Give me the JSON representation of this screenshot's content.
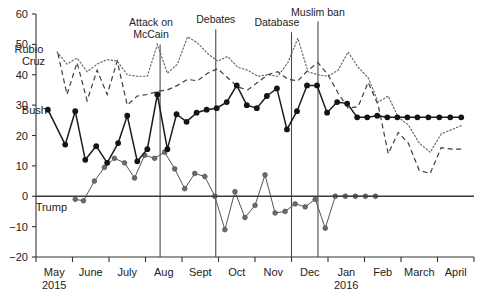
{
  "chart_data": {
    "type": "line",
    "title": "",
    "xlabel": "",
    "ylabel": "",
    "ylim": [
      -20,
      60
    ],
    "yticks": [
      -20,
      -10,
      0,
      10,
      20,
      30,
      40,
      50,
      60
    ],
    "ytick_labels": [
      "−20",
      "−10",
      "0",
      "10",
      "20",
      "30",
      "40",
      "50",
      "60"
    ],
    "grid": false,
    "legend_position": "inline-left",
    "x_axis_label_rows": [
      [
        "May",
        "June",
        "July",
        "Aug",
        "Sept",
        "Oct",
        "Nov",
        "Dec",
        "Jan",
        "Feb",
        "March",
        "April"
      ],
      [
        "2015",
        "",
        "",
        "",
        "",
        "",
        "",
        "",
        "2016",
        "",
        "",
        ""
      ]
    ],
    "x_month_ticks": [
      "May",
      "June",
      "July",
      "Aug",
      "Sept",
      "Oct",
      "Nov",
      "Dec",
      "Jan",
      "Feb",
      "March",
      "April"
    ],
    "x_range_weeks": [
      0,
      48
    ],
    "series": [
      {
        "name": "Bush",
        "style": "solid-marker",
        "color": "#141414",
        "label_x_week": 1.2,
        "label_y": 28.5,
        "x": [
          1.3,
          3.2,
          4.3,
          5.4,
          6.6,
          7.8,
          9.0,
          10.0,
          11.1,
          12.2,
          13.3,
          14.4,
          15.4,
          16.5,
          17.6,
          18.7,
          19.8,
          20.9,
          22.0,
          23.1,
          24.2,
          25.3,
          26.4,
          27.5,
          28.6,
          29.7,
          30.8,
          31.9,
          33.0,
          34.1,
          35.2,
          36.3,
          37.4,
          38.5,
          39.6,
          40.7,
          41.8,
          43.0,
          44.2,
          45.4,
          46.6
        ],
        "y": [
          28.5,
          17.0,
          28.0,
          12.0,
          16.5,
          11.0,
          17.5,
          26.5,
          11.5,
          15.5,
          33.5,
          15.5,
          27.0,
          24.5,
          27.5,
          28.5,
          29.0,
          31.0,
          36.5,
          30.0,
          29.0,
          33.0,
          35.5,
          22.0,
          28.0,
          36.5,
          36.5,
          27.5,
          31.0,
          30.5,
          26.0,
          26.0,
          26.5,
          26.0,
          26.0,
          26.0,
          26.0,
          26.0,
          26.0,
          26.0,
          26.0
        ]
      },
      {
        "name": "Trump",
        "style": "solid-marker-light",
        "color": "#6b6b6b",
        "label_x_week": 3.4,
        "label_y": -3.6,
        "x": [
          4.3,
          5.2,
          6.4,
          7.5,
          8.6,
          9.7,
          10.8,
          11.9,
          13.0,
          14.1,
          15.2,
          16.3,
          17.4,
          18.5,
          19.6,
          20.7,
          21.8,
          22.9,
          24.0,
          25.1,
          26.2,
          27.3,
          28.4,
          29.5,
          30.6,
          31.7,
          32.8,
          33.9,
          35.0,
          36.1,
          37.2
        ],
        "y": [
          -1.0,
          -1.5,
          5.0,
          9.5,
          12.5,
          11.0,
          6.0,
          13.5,
          12.5,
          14.5,
          9.0,
          2.5,
          7.5,
          6.5,
          0.0,
          -11.0,
          1.5,
          -7.0,
          -3.0,
          7.0,
          -5.5,
          -5.0,
          -2.5,
          -3.5,
          -1.0,
          -10.5,
          0.0,
          0.0,
          0.0,
          0.0,
          0.0
        ]
      },
      {
        "name": "Cruz",
        "style": "dashed",
        "color": "#3d3d3d",
        "label_x_week": 1.0,
        "label_y": 44.5,
        "x": [
          2.4,
          3.4,
          4.5,
          5.6,
          6.7,
          7.8,
          8.9,
          10.0,
          11.1,
          12.2,
          13.3,
          14.4,
          15.5,
          16.6,
          17.7,
          18.8,
          19.9,
          21.0,
          22.1,
          23.2,
          24.3,
          25.4,
          26.5,
          27.6,
          28.7,
          29.8,
          30.9,
          32.0,
          33.1,
          34.2,
          35.3,
          36.4,
          37.5,
          38.6,
          39.7,
          40.8,
          42.0,
          43.2,
          44.4,
          45.6,
          46.8
        ],
        "y": [
          47.0,
          33.5,
          44.0,
          31.5,
          41.5,
          33.5,
          44.5,
          30.0,
          33.0,
          33.5,
          34.5,
          35.0,
          36.5,
          38.5,
          38.0,
          40.5,
          42.0,
          39.0,
          36.0,
          35.0,
          37.5,
          40.0,
          41.0,
          38.5,
          38.0,
          41.5,
          44.0,
          40.0,
          34.0,
          29.0,
          29.5,
          37.5,
          30.0,
          14.0,
          21.0,
          17.5,
          8.5,
          7.5,
          16.0,
          15.5,
          15.5
        ]
      },
      {
        "name": "Rubio",
        "style": "dotted",
        "color": "#6a6a6a",
        "label_x_week": 0.8,
        "label_y": 48.5,
        "x": [
          2.3,
          3.4,
          4.5,
          5.6,
          6.7,
          7.8,
          8.9,
          10.0,
          11.1,
          12.2,
          13.3,
          14.4,
          15.5,
          16.6,
          17.7,
          18.8,
          19.9,
          21.0,
          22.1,
          23.2,
          24.3,
          25.4,
          26.5,
          27.6,
          28.7,
          29.8,
          30.9,
          32.0,
          33.1,
          34.2,
          35.3,
          36.4,
          37.5,
          38.6,
          39.7,
          40.8,
          42.0,
          43.2,
          44.4,
          45.6,
          46.8
        ],
        "y": [
          47.5,
          43.5,
          45.5,
          41.0,
          43.5,
          45.0,
          44.5,
          40.0,
          39.5,
          39.5,
          50.0,
          40.5,
          43.5,
          52.5,
          50.5,
          47.0,
          44.5,
          46.0,
          42.5,
          41.5,
          39.5,
          40.0,
          39.5,
          44.0,
          52.0,
          41.0,
          40.0,
          39.5,
          41.5,
          47.5,
          42.5,
          39.0,
          31.0,
          33.0,
          26.0,
          23.5,
          17.5,
          14.5,
          20.5,
          22.0,
          23.5
        ]
      }
    ],
    "annotations": [
      {
        "label_lines": [
          "Attack on",
          "McCain"
        ],
        "x_week": 13.6,
        "y_top": 50.0,
        "label_anchor_x_week": 12.6
      },
      {
        "label_lines": [
          "Debates"
        ],
        "x_week": 19.7,
        "y_top": 55.0,
        "label_anchor_x_week": 19.7
      },
      {
        "label_lines": [
          "Database"
        ],
        "x_week": 28.0,
        "y_top": 54.0,
        "label_anchor_x_week": 26.4
      },
      {
        "label_lines": [
          "Muslim ban"
        ],
        "x_week": 30.9,
        "y_top": 57.5,
        "label_anchor_x_week": 30.9
      }
    ]
  },
  "colors": {
    "background": "#ffffff",
    "axis": "#333333",
    "bush": "#141414",
    "trump": "#6b6b6b",
    "cruz": "#3d3d3d",
    "rubio": "#6a6a6a",
    "event_line": "#4a4a4a"
  }
}
